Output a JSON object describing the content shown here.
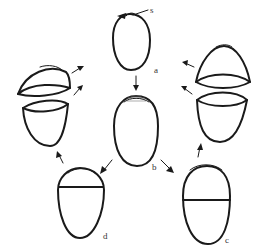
{
  "diagram": {
    "type": "process-cycle",
    "labels": {
      "s": "s",
      "a": "a",
      "b": "b",
      "c": "c",
      "d": "d"
    },
    "stages": [
      {
        "id": "a",
        "label": "a",
        "description": "intact oval with pointer at apex labeled s"
      },
      {
        "id": "b",
        "label": "b",
        "description": "oval with hatched apical cap, arrow from a"
      },
      {
        "id": "c",
        "label": "c",
        "description": "oval split by transverse line at middle"
      },
      {
        "id": "d",
        "label": "d",
        "description": "oval split by transverse line near top"
      },
      {
        "id": "open-left",
        "label": "",
        "description": "flat lid separated from deep cup (from d)"
      },
      {
        "id": "open-right",
        "label": "",
        "description": "tall dome separated from cup (from c)"
      }
    ],
    "flow": [
      [
        "a",
        "b"
      ],
      [
        "b",
        "d"
      ],
      [
        "b",
        "c"
      ],
      [
        "d",
        "open-left"
      ],
      [
        "c",
        "open-right"
      ],
      [
        "open-left",
        "a"
      ],
      [
        "open-right",
        "a"
      ]
    ],
    "colors": {
      "stroke": "#1a1a1a",
      "background": "#ffffff"
    }
  }
}
